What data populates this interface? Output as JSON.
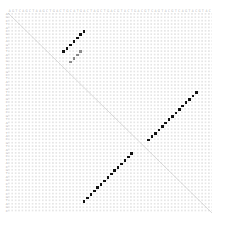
{
  "plot": {
    "type": "dotplot",
    "title": "",
    "background_color": "#ffffff",
    "grid_dot_color": "#e6e6e6",
    "match_color": "#111111",
    "diagonal_color": "#bdbdbd",
    "axis_label_color": "#aeaeae",
    "grid": {
      "columns": 60,
      "rows": 59,
      "cell_pitch_px": 3.4,
      "left_px": 8,
      "top_px": 13,
      "width_px": 204,
      "height_px": 200
    },
    "x_axis": {
      "label": "",
      "tick_labels": [
        "A",
        "G",
        "T",
        "C",
        "A",
        "G",
        "C",
        "T",
        "A",
        "A",
        "G",
        "C",
        "T",
        "G",
        "A",
        "C",
        "T",
        "G",
        "C",
        "A",
        "T",
        "G",
        "A",
        "C",
        "T",
        "A",
        "G",
        "C",
        "T",
        "G",
        "A",
        "C",
        "G",
        "T",
        "A",
        "C",
        "T",
        "G",
        "A",
        "C",
        "G",
        "T",
        "C",
        "A",
        "G",
        "T",
        "A",
        "C",
        "G",
        "T",
        "C",
        "A",
        "G",
        "T",
        "A",
        "C",
        "G",
        "T",
        "A",
        "C"
      ]
    },
    "y_axis": {
      "label": "",
      "tick_labels": [
        "A",
        "G",
        "C",
        "T",
        "A",
        "C",
        "G",
        "T",
        "A",
        "G",
        "C",
        "T",
        "A",
        "C",
        "G",
        "T",
        "A",
        "G",
        "C",
        "T",
        "A",
        "C",
        "G",
        "T",
        "A",
        "G",
        "C",
        "T",
        "A",
        "C",
        "G",
        "T",
        "A",
        "G",
        "C",
        "T",
        "A",
        "C",
        "G",
        "T",
        "A",
        "G",
        "C",
        "T",
        "A",
        "C",
        "G",
        "T",
        "A",
        "G",
        "C",
        "T",
        "A",
        "C",
        "G",
        "T",
        "A",
        "G",
        "C"
      ]
    },
    "diagonal": {
      "visible": true,
      "from": [
        0,
        0
      ],
      "to": [
        59,
        58
      ]
    }
  },
  "chart_data": {
    "type": "scatter",
    "title": "",
    "xlabel": "",
    "ylabel": "",
    "xlim": [
      0,
      60
    ],
    "ylim": [
      0,
      59
    ],
    "grid": true,
    "legend": "none",
    "series": [
      {
        "name": "main-diagonal",
        "style": "line",
        "color": "#bdbdbd",
        "x": [
          0,
          59
        ],
        "y": [
          0,
          58
        ]
      },
      {
        "name": "match-run-upper-right",
        "style": "squares",
        "color": "#111111",
        "x": [
          16,
          17,
          18,
          19,
          20,
          21,
          22
        ],
        "y": [
          11,
          10,
          9,
          8,
          7,
          6,
          5
        ]
      },
      {
        "name": "match-run-upper-right-faint",
        "style": "squares",
        "color": "#8a8a8a",
        "x": [
          18,
          19,
          20,
          21
        ],
        "y": [
          14,
          13,
          12,
          11
        ]
      },
      {
        "name": "match-run-lower-right",
        "style": "squares",
        "color": "#111111",
        "x": [
          41,
          42,
          43,
          44,
          45,
          46,
          47,
          48,
          49,
          50,
          51,
          52,
          53,
          54,
          55
        ],
        "y": [
          37,
          36,
          35,
          34,
          33,
          32,
          31,
          30,
          29,
          28,
          27,
          26,
          25,
          24,
          23
        ]
      },
      {
        "name": "match-run-lower-left",
        "style": "squares",
        "color": "#111111",
        "x": [
          22,
          23,
          24,
          25,
          26,
          27,
          28,
          29,
          30,
          31,
          32,
          33,
          34,
          35,
          36
        ],
        "y": [
          55,
          54,
          53,
          52,
          51,
          50,
          49,
          48,
          47,
          46,
          45,
          44,
          43,
          42,
          41
        ]
      }
    ]
  }
}
